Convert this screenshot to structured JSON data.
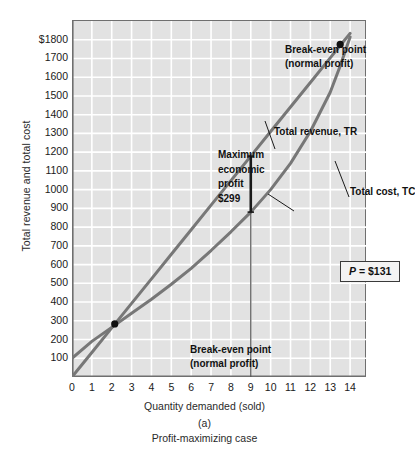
{
  "chart_data": {
    "type": "line",
    "title": "",
    "xlabel": "Quantity demanded (sold)",
    "ylabel": "Total revenue and total cost",
    "xlim": [
      0,
      14.8
    ],
    "ylim": [
      0,
      1900
    ],
    "grid": true,
    "legend": "inline-annotations",
    "x_ticks": [
      0,
      1,
      2,
      3,
      4,
      5,
      6,
      7,
      8,
      9,
      10,
      11,
      12,
      13,
      14
    ],
    "x_tick_labels": [
      "0",
      "1",
      "2",
      "3",
      "4",
      "5",
      "6",
      "7",
      "8",
      "9",
      "10",
      "11",
      "12",
      "13",
      "14"
    ],
    "y_ticks": [
      100,
      200,
      300,
      400,
      500,
      600,
      700,
      800,
      900,
      1000,
      1100,
      1200,
      1300,
      1400,
      1500,
      1600,
      1700,
      1800
    ],
    "y_tick_labels": [
      "100",
      "200",
      "300",
      "400",
      "500",
      "600",
      "700",
      "800",
      "900",
      "1000",
      "1100",
      "1200",
      "1300",
      "1400",
      "1500",
      "1600",
      "1700",
      "$1800"
    ],
    "series": [
      {
        "name": "Total revenue, TR",
        "color": "#777777",
        "points": [
          [
            0,
            0
          ],
          [
            1,
            131
          ],
          [
            2,
            262
          ],
          [
            3,
            393
          ],
          [
            4,
            524
          ],
          [
            5,
            655
          ],
          [
            6,
            786
          ],
          [
            7,
            917
          ],
          [
            8,
            1048
          ],
          [
            9,
            1179
          ],
          [
            10,
            1310
          ],
          [
            11,
            1441
          ],
          [
            12,
            1572
          ],
          [
            13,
            1703
          ],
          [
            13.5,
            1769
          ],
          [
            14,
            1834
          ]
        ]
      },
      {
        "name": "Total cost, TC",
        "color": "#777777",
        "points": [
          [
            0,
            100
          ],
          [
            1,
            190
          ],
          [
            2,
            265
          ],
          [
            3,
            340
          ],
          [
            4,
            415
          ],
          [
            5,
            495
          ],
          [
            6,
            580
          ],
          [
            7,
            675
          ],
          [
            8,
            775
          ],
          [
            9,
            880
          ],
          [
            10,
            1000
          ],
          [
            11,
            1140
          ],
          [
            12,
            1310
          ],
          [
            13,
            1520
          ],
          [
            13.5,
            1660
          ],
          [
            14,
            1815
          ]
        ]
      }
    ],
    "markers": [
      {
        "name": "break-even-lower",
        "x": 2.15,
        "y": 283
      },
      {
        "name": "break-even-upper",
        "x": 13.5,
        "y": 1775
      }
    ],
    "profit_bracket": {
      "x": 9,
      "y_top": 1179,
      "y_bottom": 880
    },
    "vertical_line": {
      "x": 9,
      "y_top": 880,
      "y_bottom": 0
    }
  },
  "annotations": {
    "breakeven_top_line1": "Break-even point",
    "breakeven_top_line2": "(normal profit)",
    "breakeven_bottom_line1": "Break-even point",
    "breakeven_bottom_line2": "(normal profit)",
    "total_revenue_label": "Total revenue, TR",
    "total_cost_label": "Total cost, TC",
    "max_profit_line1": "Maximum",
    "max_profit_line2": "economic",
    "max_profit_line3": "profit",
    "max_profit_line4": "$299",
    "price_symbol": "P",
    "price_value": " = $131"
  },
  "captions": {
    "x_axis_title": "Quantity demanded (sold)",
    "y_axis_title": "Total revenue and total cost",
    "panel_letter": "(a)",
    "panel_caption": "Profit-maximizing case"
  },
  "colors": {
    "plot_background": "#e2e2e2",
    "gridline": "#ffffff",
    "axis": "#6f6f6f",
    "curve": "#777777",
    "marker": "#111111",
    "text": "#111111"
  }
}
